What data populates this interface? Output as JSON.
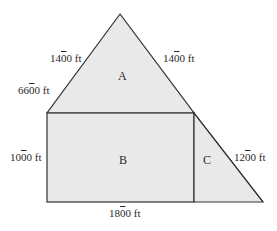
{
  "diagram": {
    "type": "composite-area-figure",
    "colors": {
      "fill": "#e9e9e9",
      "stroke": "#333333",
      "text": "#2a2a2a",
      "background": "#ffffff"
    },
    "shapes": [
      {
        "id": "A",
        "kind": "triangle",
        "points": [
          [
            120,
            14
          ],
          [
            47,
            113
          ],
          [
            194,
            113
          ]
        ]
      },
      {
        "id": "B",
        "kind": "rectangle",
        "x": 47,
        "y": 113,
        "width": 147,
        "height": 89
      },
      {
        "id": "C",
        "kind": "right-triangle",
        "points": [
          [
            194,
            113
          ],
          [
            194,
            202
          ],
          [
            263,
            202
          ]
        ]
      }
    ],
    "region_labels": {
      "A": "A",
      "B": "B",
      "C": "C"
    },
    "measurements": [
      {
        "id": "tri_left_upper",
        "pre": "14",
        "bar": "0",
        "post": "0 ft"
      },
      {
        "id": "tri_right",
        "pre": "14",
        "bar": "0",
        "post": "0 ft"
      },
      {
        "id": "tri_left_lower",
        "pre": "66",
        "bar": "0",
        "post": "0 ft"
      },
      {
        "id": "rect_height",
        "pre": "10",
        "bar": "0",
        "post": "0 ft"
      },
      {
        "id": "hypotenuse_c",
        "pre": "12",
        "bar": "0",
        "post": "0 ft"
      },
      {
        "id": "rect_width",
        "pre": "18",
        "bar": "0",
        "post": "0 ft"
      }
    ]
  }
}
